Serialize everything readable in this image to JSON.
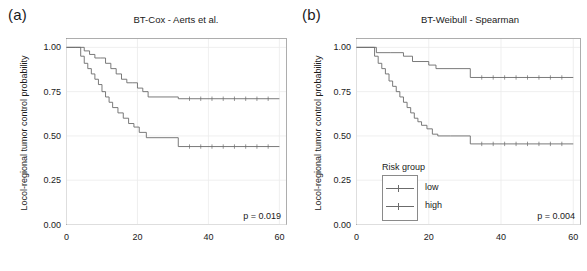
{
  "figure": {
    "panels": [
      {
        "tag": "(a)",
        "title": "BT-Cox - Aerts et al.",
        "pvalue": "p = 0.019",
        "show_legend": false
      },
      {
        "tag": "(b)",
        "title": "BT-Weibull - Spearman",
        "pvalue": "p = 0.004",
        "show_legend": true
      }
    ],
    "legend": {
      "title": "Risk group",
      "items": [
        {
          "label": "low",
          "color": "#6b6b6b"
        },
        {
          "label": "high",
          "color": "#6b6b6b"
        }
      ]
    },
    "axis": {
      "ylabel": "Locol-regional tumor control probability",
      "xlabel": "",
      "yticks": [
        "0.00",
        "0.25",
        "0.50",
        "0.75",
        "1.00"
      ],
      "xticks": [
        "0",
        "20",
        "40",
        "60"
      ]
    }
  },
  "chart_data": [
    {
      "type": "line",
      "title": "BT-Cox - Aerts et al.",
      "subtitle": "(a)",
      "xlabel": "",
      "ylabel": "Locol-regional tumor control probability",
      "xlim": [
        0,
        62
      ],
      "ylim": [
        0,
        1.05
      ],
      "xticks": [
        0,
        20,
        40,
        60
      ],
      "yticks": [
        0.0,
        0.25,
        0.5,
        0.75,
        1.0
      ],
      "grid": true,
      "legend_position": "none",
      "annotations": [
        "p = 0.019"
      ],
      "step": "post",
      "series": [
        {
          "name": "low",
          "color": "#6b6b6b",
          "x": [
            0,
            3.0,
            5.0,
            6.5,
            8.0,
            9.5,
            11.0,
            12.5,
            14.0,
            15.5,
            17.0,
            18.5,
            20.0,
            21.5,
            23.0,
            31.5,
            60.0
          ],
          "y": [
            1.0,
            1.0,
            0.98,
            0.96,
            0.94,
            0.94,
            0.91,
            0.88,
            0.85,
            0.82,
            0.8,
            0.8,
            0.77,
            0.75,
            0.72,
            0.71,
            0.71
          ]
        },
        {
          "name": "high",
          "color": "#6b6b6b",
          "x": [
            0,
            2.5,
            4.0,
            5.0,
            6.0,
            7.0,
            8.0,
            9.0,
            10.0,
            11.0,
            12.0,
            13.0,
            14.5,
            16.0,
            17.5,
            19.0,
            20.5,
            22.5,
            31.5,
            60.0
          ],
          "y": [
            1.0,
            1.0,
            0.95,
            0.91,
            0.88,
            0.85,
            0.82,
            0.79,
            0.75,
            0.72,
            0.69,
            0.66,
            0.63,
            0.6,
            0.57,
            0.55,
            0.52,
            0.49,
            0.44,
            0.44
          ]
        }
      ]
    },
    {
      "type": "line",
      "title": "BT-Weibull - Spearman",
      "subtitle": "(b)",
      "xlabel": "",
      "ylabel": "Locol-regional tumor control probability",
      "xlim": [
        0,
        62
      ],
      "ylim": [
        0,
        1.05
      ],
      "xticks": [
        0,
        20,
        40,
        60
      ],
      "yticks": [
        0.0,
        0.25,
        0.5,
        0.75,
        1.0
      ],
      "grid": true,
      "legend_position": "lower-left",
      "annotations": [
        "p = 0.004"
      ],
      "step": "post",
      "series": [
        {
          "name": "low",
          "color": "#6b6b6b",
          "x": [
            0,
            4.0,
            5.5,
            9.5,
            13.0,
            15.5,
            20.0,
            22.0,
            31.5,
            60.0
          ],
          "y": [
            1.0,
            1.0,
            0.97,
            0.97,
            0.95,
            0.92,
            0.9,
            0.88,
            0.83,
            0.83
          ]
        },
        {
          "name": "high",
          "color": "#6b6b6b",
          "x": [
            0,
            3.5,
            5.0,
            6.0,
            7.0,
            8.0,
            9.0,
            10.0,
            11.0,
            12.0,
            13.0,
            14.0,
            15.0,
            16.0,
            17.0,
            18.0,
            19.5,
            21.0,
            22.5,
            26.0,
            31.5,
            60.0
          ],
          "y": [
            1.0,
            1.0,
            0.95,
            0.91,
            0.88,
            0.85,
            0.81,
            0.78,
            0.75,
            0.72,
            0.69,
            0.66,
            0.63,
            0.6,
            0.58,
            0.56,
            0.54,
            0.51,
            0.5,
            0.5,
            0.455,
            0.455
          ]
        }
      ]
    }
  ]
}
